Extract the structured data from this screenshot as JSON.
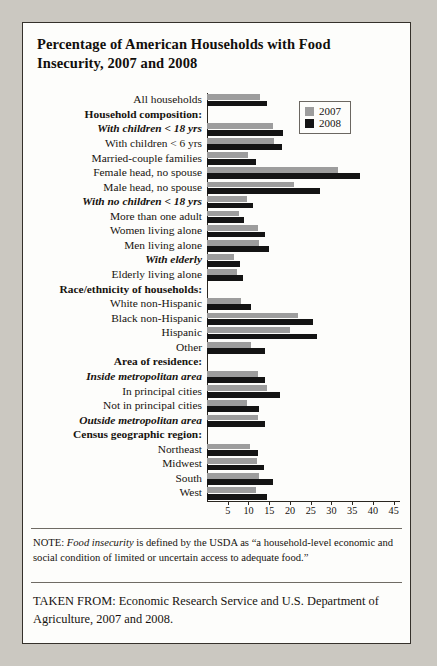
{
  "title": "Percentage of American Households with Food Insecurity, 2007 and 2008",
  "legend": {
    "series1": "2007",
    "series2": "2008"
  },
  "colors": {
    "y2007": "#9d9d9d",
    "y2008": "#141414",
    "border": "#35312b",
    "page": "#cbc8c1"
  },
  "note": {
    "prefix": "NOTE: ",
    "italic": "Food insecurity",
    "rest": " is defined by the USDA as “a household-level economic and social condition of limited or uncertain access to adequate food.”"
  },
  "source": "TAKEN FROM: Economic Research Service and U.S. Department of Agriculture, 2007 and 2008.",
  "chart_data": {
    "type": "bar",
    "orientation": "horizontal",
    "title": "Percentage of American Households with Food Insecurity, 2007 and 2008",
    "xlabel": "",
    "ylabel": "",
    "xlim": [
      0,
      47
    ],
    "xticks": [
      5,
      10,
      15,
      20,
      25,
      30,
      35,
      40,
      45
    ],
    "grid": false,
    "legend_position": "top-right",
    "series": [
      {
        "name": "2007",
        "color": "#9d9d9d"
      },
      {
        "name": "2008",
        "color": "#141414"
      }
    ],
    "rows": [
      {
        "label": "All households",
        "style": "plain",
        "header": false,
        "v2007": 13.0,
        "v2008": 14.6
      },
      {
        "label": "Household composition:",
        "style": "hdr",
        "header": true
      },
      {
        "label": "With children < 18 yrs",
        "style": "sub",
        "header": false,
        "v2007": 16.0,
        "v2008": 18.5
      },
      {
        "label": "With children < 6 yrs",
        "style": "plain",
        "header": false,
        "v2007": 16.3,
        "v2008": 18.3
      },
      {
        "label": "Married-couple families",
        "style": "plain",
        "header": false,
        "v2007": 10.1,
        "v2008": 12.0
      },
      {
        "label": "Female head, no spouse",
        "style": "plain",
        "header": false,
        "v2007": 32.0,
        "v2008": 37.2
      },
      {
        "label": "Male head, no spouse",
        "style": "plain",
        "header": false,
        "v2007": 21.2,
        "v2008": 27.6
      },
      {
        "label": "With no children < 18 yrs",
        "style": "sub",
        "header": false,
        "v2007": 9.8,
        "v2008": 11.3
      },
      {
        "label": "More than one adult",
        "style": "plain",
        "header": false,
        "v2007": 7.7,
        "v2008": 8.9
      },
      {
        "label": "Women living alone",
        "style": "plain",
        "header": false,
        "v2007": 12.4,
        "v2008": 14.1
      },
      {
        "label": "Men living alone",
        "style": "plain",
        "header": false,
        "v2007": 12.6,
        "v2008": 15.0
      },
      {
        "label": "With elderly",
        "style": "sub",
        "header": false,
        "v2007": 6.5,
        "v2008": 8.1
      },
      {
        "label": "Elderly living alone",
        "style": "plain",
        "header": false,
        "v2007": 7.3,
        "v2008": 8.8
      },
      {
        "label": "Race/ethnicity of households:",
        "style": "hdr",
        "header": true
      },
      {
        "label": "White non-Hispanic",
        "style": "plain",
        "header": false,
        "v2007": 8.4,
        "v2008": 10.7
      },
      {
        "label": "Black non-Hispanic",
        "style": "plain",
        "header": false,
        "v2007": 22.2,
        "v2008": 25.7
      },
      {
        "label": "Hispanic",
        "style": "plain",
        "header": false,
        "v2007": 20.1,
        "v2008": 26.9
      },
      {
        "label": "Other",
        "style": "plain",
        "header": false,
        "v2007": 10.7,
        "v2008": 14.2
      },
      {
        "label": "Area of residence:",
        "style": "hdr",
        "header": true
      },
      {
        "label": "Inside metropolitan area",
        "style": "sub",
        "header": false,
        "v2007": 12.4,
        "v2008": 14.2
      },
      {
        "label": "In principal cities",
        "style": "plain",
        "header": false,
        "v2007": 14.6,
        "v2008": 17.7
      },
      {
        "label": "Not in principal cities",
        "style": "plain",
        "header": false,
        "v2007": 9.7,
        "v2008": 12.7
      },
      {
        "label": "Outside metropolitan area",
        "style": "sub",
        "header": false,
        "v2007": 12.5,
        "v2008": 14.2
      },
      {
        "label": "Census geographic region:",
        "style": "hdr",
        "header": true
      },
      {
        "label": "Northeast",
        "style": "plain",
        "header": false,
        "v2007": 10.5,
        "v2008": 12.3
      },
      {
        "label": "Midwest",
        "style": "plain",
        "header": false,
        "v2007": 12.1,
        "v2008": 14.0
      },
      {
        "label": "South",
        "style": "plain",
        "header": false,
        "v2007": 12.6,
        "v2008": 16.1
      },
      {
        "label": "West",
        "style": "plain",
        "header": false,
        "v2007": 12.0,
        "v2008": 14.6
      }
    ]
  }
}
